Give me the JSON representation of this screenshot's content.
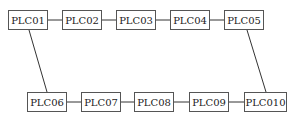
{
  "diagram": {
    "type": "ring-topology",
    "top_row": [
      {
        "id": "PLC01",
        "label": "PLC01",
        "x": 8,
        "y": 10,
        "w": 40
      },
      {
        "id": "PLC02",
        "label": "PLC02",
        "x": 62,
        "y": 10,
        "w": 40
      },
      {
        "id": "PLC03",
        "label": "PLC03",
        "x": 116,
        "y": 10,
        "w": 40
      },
      {
        "id": "PLC04",
        "label": "PLC04",
        "x": 170,
        "y": 10,
        "w": 40
      },
      {
        "id": "PLC05",
        "label": "PLC05",
        "x": 224,
        "y": 10,
        "w": 40
      }
    ],
    "bottom_row": [
      {
        "id": "PLC06",
        "label": "PLC06",
        "x": 27,
        "y": 92,
        "w": 40
      },
      {
        "id": "PLC07",
        "label": "PLC07",
        "x": 81,
        "y": 92,
        "w": 40
      },
      {
        "id": "PLC08",
        "label": "PLC08",
        "x": 134,
        "y": 92,
        "w": 40
      },
      {
        "id": "PLC09",
        "label": "PLC09",
        "x": 189,
        "y": 92,
        "w": 40
      },
      {
        "id": "PLC010",
        "label": "PLC010",
        "x": 244,
        "y": 92,
        "w": 43
      }
    ],
    "edges": [
      [
        "PLC01",
        "PLC02"
      ],
      [
        "PLC02",
        "PLC03"
      ],
      [
        "PLC03",
        "PLC04"
      ],
      [
        "PLC04",
        "PLC05"
      ],
      [
        "PLC05",
        "PLC010"
      ],
      [
        "PLC06",
        "PLC07"
      ],
      [
        "PLC07",
        "PLC08"
      ],
      [
        "PLC08",
        "PLC09"
      ],
      [
        "PLC09",
        "PLC010"
      ],
      [
        "PLC01",
        "PLC06"
      ]
    ]
  }
}
